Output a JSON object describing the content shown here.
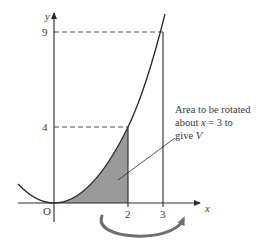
{
  "diagram": {
    "function": "y = x^2",
    "axes": {
      "x_label": "x",
      "y_label": "y",
      "origin_label": "O"
    },
    "x_ticks": [
      {
        "value": 2,
        "label": "2"
      },
      {
        "value": 3,
        "label": "3"
      }
    ],
    "y_ticks": [
      {
        "value": 4,
        "label": "4"
      },
      {
        "value": 9,
        "label": "9"
      }
    ],
    "shaded_region": {
      "description": "Area under y = x^2 from x = 0 to x = 2",
      "fill_color": "#9a9a9a"
    },
    "vertical_lines": [
      {
        "x": 2,
        "to_y": 4
      },
      {
        "x": 3,
        "to_y": 9
      }
    ],
    "dashed_lines": [
      {
        "y": 4,
        "from_x": 0,
        "to_x": 2
      },
      {
        "y": 9,
        "from_x": 0,
        "to_x": 3
      }
    ],
    "annotation": {
      "line1": "Area to be rotated",
      "line2_prefix": "about ",
      "line2_var": "x",
      "line2_suffix": " = 3 to",
      "line3_prefix": "give ",
      "line3_var": "V"
    },
    "rotation_arrow": {
      "description": "Curved arrow indicating rotation about x = 3",
      "color": "#6e6e6e"
    },
    "colors": {
      "line": "#2a2a2a",
      "text": "#3a3a3a",
      "shade": "#9a9a9a",
      "arrow": "#6e6e6e"
    }
  }
}
